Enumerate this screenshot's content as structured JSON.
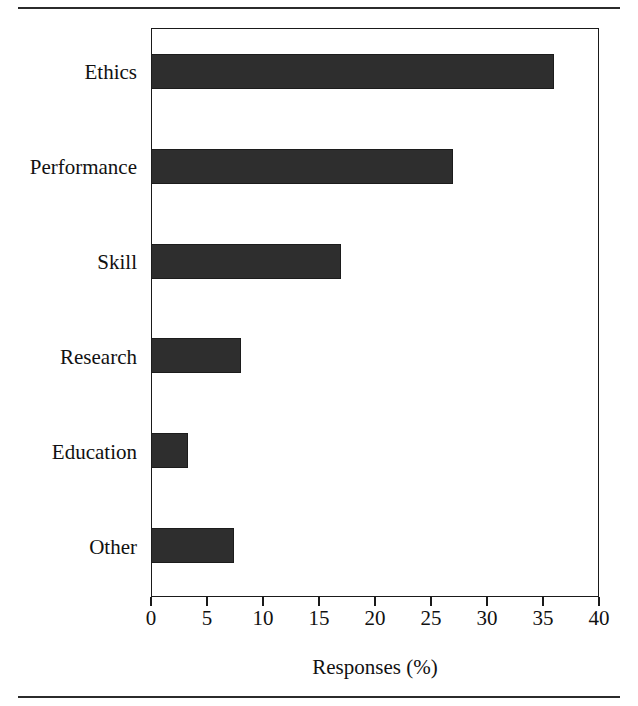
{
  "figure": {
    "background_color": "#ffffff",
    "bar_color": "#2e2e2e",
    "axis_color": "#1a1a1a",
    "rule_top": "horizontal-rule",
    "rule_bottom": "horizontal-rule"
  },
  "chart_data": {
    "type": "bar",
    "orientation": "horizontal",
    "title": "",
    "subtitle": "",
    "xlabel": "Responses (%)",
    "ylabel": "",
    "categories": [
      "Ethics",
      "Performance",
      "Skill",
      "Research",
      "Education",
      "Other"
    ],
    "values": [
      36.0,
      27.0,
      17.0,
      8.0,
      3.3,
      7.4
    ],
    "series": [
      {
        "name": "Responses",
        "values": [
          36.0,
          27.0,
          17.0,
          8.0,
          3.3,
          7.4
        ]
      }
    ],
    "xlim": [
      0,
      40
    ],
    "ylim": [
      0,
      6
    ],
    "xticks": [
      0,
      5,
      10,
      15,
      20,
      25,
      30,
      35,
      40
    ],
    "xtick_labels": [
      "0",
      "5",
      "10",
      "15",
      "20",
      "25",
      "30",
      "35",
      "40"
    ],
    "ytick_labels": [
      "Ethics",
      "Performance",
      "Skill",
      "Research",
      "Education",
      "Other"
    ],
    "grid": false,
    "legend": false,
    "legend_position": "none",
    "annotations": []
  }
}
